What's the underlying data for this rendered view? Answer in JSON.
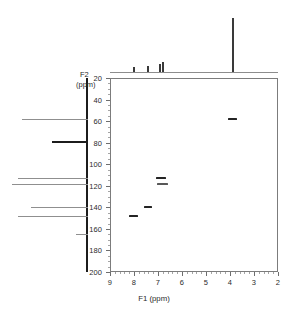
{
  "figure": {
    "type": "2d-nmr-spectrum",
    "experiment": "HSQC",
    "background": "#ffffff",
    "frame_color": "#7c7c7c"
  },
  "axes": {
    "x": {
      "title": "F1 (ppm)",
      "min": 2,
      "max": 9,
      "reversed": true,
      "ticks": [
        9,
        8,
        7,
        6,
        5,
        4,
        3,
        2
      ],
      "tick_labels": [
        "9",
        "8",
        "7",
        "6",
        "5",
        "4",
        "3",
        "2"
      ],
      "minor_step": 0.2
    },
    "y": {
      "title": "F2",
      "unit": "(ppm)",
      "min": 20,
      "max": 200,
      "reversed": true,
      "ticks": [
        20,
        40,
        60,
        80,
        100,
        120,
        140,
        160,
        180,
        200
      ],
      "tick_labels": [
        "20",
        "40",
        "60",
        "80",
        "100",
        "120",
        "140",
        "160",
        "180",
        "200"
      ],
      "minor_step": 5
    }
  },
  "chart_data": {
    "type": "scatter",
    "title": "",
    "xlabel": "F1 (ppm)",
    "ylabel": "F2 (ppm)",
    "xlim": [
      9,
      2
    ],
    "ylim": [
      200,
      20
    ],
    "grid": false,
    "legend": "none",
    "cross_peaks": [
      {
        "x": 8.02,
        "y": 148.0,
        "w": 9,
        "h": 2,
        "intensity": "medium"
      },
      {
        "x": 7.42,
        "y": 140.0,
        "w": 8,
        "h": 2,
        "intensity": "medium"
      },
      {
        "x": 6.88,
        "y": 112.5,
        "w": 10,
        "h": 2,
        "intensity": "medium"
      },
      {
        "x": 6.82,
        "y": 118.0,
        "w": 11,
        "h": 2,
        "intensity": "weak"
      },
      {
        "x": 3.88,
        "y": 58.0,
        "w": 9,
        "h": 2,
        "intensity": "strong"
      }
    ],
    "f1_projection": {
      "axis": "top",
      "baseline_ppm_range": [
        9,
        2
      ],
      "peaks": [
        {
          "ppm": 8.02,
          "height": 5,
          "width": 2,
          "label": ""
        },
        {
          "ppm": 7.42,
          "height": 6,
          "width": 2,
          "label": ""
        },
        {
          "ppm": 6.9,
          "height": 8,
          "width": 2,
          "label": ""
        },
        {
          "ppm": 6.78,
          "height": 10,
          "width": 2,
          "label": ""
        },
        {
          "ppm": 3.88,
          "height": 54,
          "width": 2,
          "label": ""
        }
      ]
    },
    "f2_projection": {
      "axis": "left",
      "peaks": [
        {
          "ppm": 58.0,
          "length": 66,
          "weight": "light",
          "label": ""
        },
        {
          "ppm": 78.0,
          "length": 36,
          "weight": "bold",
          "label": ""
        },
        {
          "ppm": 112.5,
          "length": 70,
          "weight": "light",
          "label": ""
        },
        {
          "ppm": 118.0,
          "length": 76,
          "weight": "light",
          "label": ""
        },
        {
          "ppm": 140.0,
          "length": 57,
          "weight": "light",
          "label": ""
        },
        {
          "ppm": 148.0,
          "length": 70,
          "weight": "light",
          "label": ""
        },
        {
          "ppm": 165.0,
          "length": 12,
          "weight": "light",
          "label": ""
        }
      ]
    }
  }
}
